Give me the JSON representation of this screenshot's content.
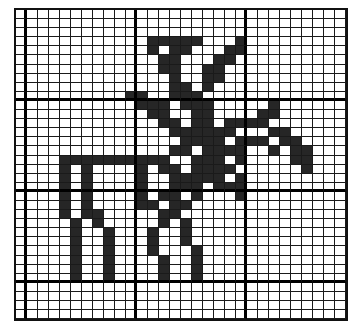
{
  "pattern": {
    "title": "",
    "columns": 30,
    "rows": 34,
    "fill_color": "#262626",
    "empty_color": "#ffffff",
    "grid_color": "#1a1a1a",
    "major_every": 10,
    "major_col_offset": 1,
    "major_row_offset": 0,
    "bitmap": [
      "..............................",
      "..............................",
      "..............................",
      "............#####...#.........",
      "............#.##...##.........",
      ".............##...##..........",
      ".............##..##...........",
      "..............#..##...........",
      "..............##.#............",
      "..........##..###.............",
      "...........###.###.....#......",
      "............##..##....##......",
      ".............##.##.####.......",
      "..............######...##.....",
      "...............####.###.##....",
      "..............##.####..#.##...",
      "....##########..###.#....##...",
      "....#.#....#.##.####......#...",
      "....#.#....#..#####.#.........",
      "....#.#....#..###.###.........",
      "....#.#....#.##.#...#.........",
      "....#.#....##.##..............",
      "....#.##.....##...............",
      ".....#.#.....#.#..............",
      ".....#..#...#..#..............",
      ".....#..#...#..#..............",
      ".....#..#...#...#.............",
      ".....#..#....#..#.............",
      ".....#..#....#..#.............",
      ".....#..#....#..#.............",
      "..............................",
      "..............................",
      "..............................",
      ".............................."
    ]
  }
}
